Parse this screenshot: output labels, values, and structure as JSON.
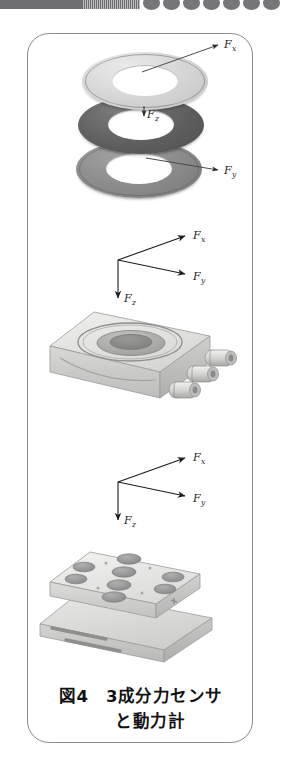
{
  "figure": {
    "caption_line1": "図4　3成分力センサ",
    "caption_line2": "と動力計",
    "caption_full": "図4 3成分力センサと動力計",
    "figure_number": "図4",
    "panel_border_color": "#8a8a8e",
    "panel_background": "#ffffff"
  },
  "scan_artifact": {
    "name": "page-edge-scan-band",
    "bar_color": "#6e6e70",
    "dot_color": "#77777a",
    "dot_count": 7
  },
  "force_labels": {
    "fx": "F",
    "fx_sub": "x",
    "fy": "F",
    "fy_sub": "y",
    "fz": "F",
    "fz_sub": "z"
  },
  "ring_stack": {
    "name": "exploded-washer-stack",
    "rings": [
      {
        "id": "ring-top",
        "label_main": "F",
        "label_sub": "x",
        "color": "#d4d4d4",
        "shade": "light"
      },
      {
        "id": "ring-mid",
        "label_main": "F",
        "label_sub": "z",
        "color": "#5f5f5f",
        "shade": "dark"
      },
      {
        "id": "ring-bot",
        "label_main": "F",
        "label_sub": "y",
        "color": "#8a8a8a",
        "shade": "medium"
      }
    ]
  },
  "triads": [
    {
      "id": "triad-upper",
      "axes": [
        {
          "axis": "fx",
          "label_main": "F",
          "label_sub": "x",
          "direction": "up-right"
        },
        {
          "axis": "fy",
          "label_main": "F",
          "label_sub": "y",
          "direction": "down-right"
        },
        {
          "axis": "fz",
          "label_main": "F",
          "label_sub": "z",
          "direction": "down"
        }
      ]
    },
    {
      "id": "triad-lower",
      "axes": [
        {
          "axis": "fx",
          "label_main": "F",
          "label_sub": "x",
          "direction": "up-right"
        },
        {
          "axis": "fy",
          "label_main": "F",
          "label_sub": "y",
          "direction": "down-right"
        },
        {
          "axis": "fz",
          "label_main": "F",
          "label_sub": "z",
          "direction": "down"
        }
      ]
    }
  ],
  "devices": [
    {
      "id": "three-component-force-sensor",
      "name_ja": "3成分力センサ",
      "body_color": "#dededc",
      "top_recess_color": "#b9b9b7",
      "connector_count": 3
    },
    {
      "id": "dynamometer",
      "name_ja": "動力計",
      "top_plate_color": "#e2e2e0",
      "base_plate_color": "#d2d2d0",
      "hole_count": 8,
      "slot_count": 2
    }
  ]
}
